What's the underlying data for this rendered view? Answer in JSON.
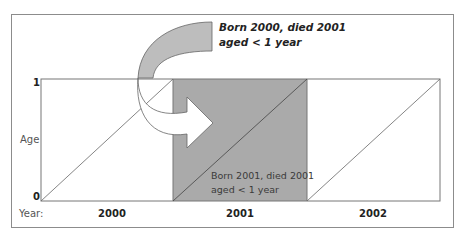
{
  "diagram": {
    "type": "lexis_diagram",
    "y_axis": {
      "label": "Age",
      "ticks": [
        "1",
        "0"
      ]
    },
    "x_axis": {
      "label": "Year:",
      "years": [
        "2000",
        "2001",
        "2002"
      ]
    },
    "highlighted_cell": {
      "year": "2001",
      "fill_color": "#aaaaaa",
      "note_line1": "Born 2001, died 2001",
      "note_line2": "aged < 1 year"
    },
    "callout": {
      "line1": "Born 2000, died 2001",
      "line2": "aged < 1 year"
    },
    "colors": {
      "frame": "#8c8c8c",
      "grid": "#777777",
      "shade": "#aaaaaa",
      "arrow_fill_back": "#bdbdbd",
      "arrow_fill_front": "#ffffff"
    }
  }
}
